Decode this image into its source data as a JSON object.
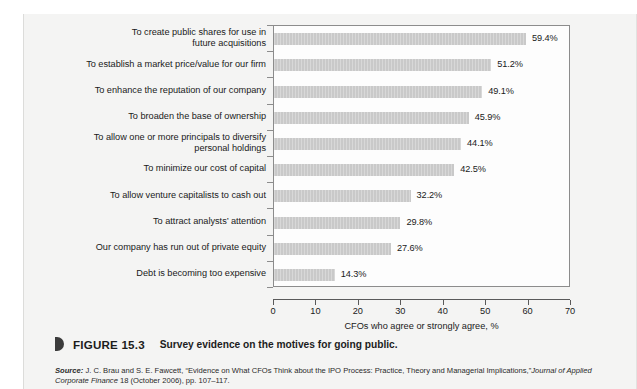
{
  "figure": {
    "marker_icon": "triangle-marker-icon",
    "number": "FIGURE 15.3",
    "title": "Survey evidence on the motives for going public."
  },
  "source": {
    "label": "Source:",
    "line1": " J. C. Brau and S. E. Fawcett, “Evidence on What CFOs Think about the IPO Process: Practice, Theory and Managerial Implications,”",
    "journal": "Journal of Applied Corporate Finance",
    "line2": " 18 (October 2006), pp. 107–117."
  },
  "chart_data": {
    "type": "bar",
    "orientation": "horizontal",
    "title": "Survey evidence on the motives for going public.",
    "xlabel": "CFOs who agree or strongly agree, %",
    "ylabel": "",
    "xlim": [
      0,
      70
    ],
    "xticks": [
      0,
      10,
      20,
      30,
      40,
      50,
      60,
      70
    ],
    "xtick_labels": [
      "0",
      "10",
      "20",
      "30",
      "40",
      "50",
      "60",
      "70"
    ],
    "grid": false,
    "legend": null,
    "bar_color": "#c9c9c9",
    "categories": [
      "To create public shares for use in future acquisitions",
      "To establish a market price/value for our firm",
      "To enhance the reputation of our company",
      "To broaden the base of ownership",
      "To allow one or more principals to diversify personal holdings",
      "To minimize our cost of capital",
      "To allow venture capitalists to cash out",
      "To attract analysts’ attention",
      "Our company has run out of private equity",
      "Debt is becoming too expensive"
    ],
    "category_lines": [
      [
        "To create public shares for use in",
        "future acquisitions"
      ],
      [
        "To establish a market price/value for our firm"
      ],
      [
        "To enhance the reputation of our company"
      ],
      [
        "To broaden the base of ownership"
      ],
      [
        "To allow one or more principals to diversify",
        "personal holdings"
      ],
      [
        "To minimize our cost of capital"
      ],
      [
        "To allow venture capitalists to cash out"
      ],
      [
        "To attract analysts’ attention"
      ],
      [
        "Our company has run out of private equity"
      ],
      [
        "Debt is becoming too expensive"
      ]
    ],
    "values": [
      59.4,
      51.2,
      49.1,
      45.9,
      44.1,
      42.5,
      32.2,
      29.8,
      27.6,
      14.3
    ],
    "value_labels": [
      "59.4%",
      "51.2%",
      "49.1%",
      "45.9%",
      "44.1%",
      "42.5%",
      "32.2%",
      "29.8%",
      "27.6%",
      "14.3%"
    ]
  }
}
